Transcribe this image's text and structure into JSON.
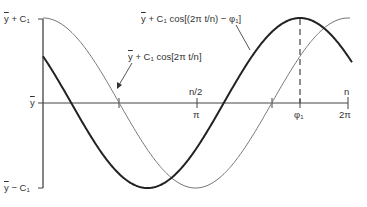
{
  "diagram": {
    "type": "cosine-phase-shift",
    "axis": {
      "y_labels": {
        "top": "y + C₁",
        "middle": "y",
        "bottom": "y − C₁"
      },
      "x_ticks": [
        {
          "top": "n/2",
          "bottom": "π"
        },
        {
          "top": "",
          "bottom": "φ₁"
        },
        {
          "top": "n",
          "bottom": "2π"
        }
      ]
    },
    "curves": [
      {
        "name": "reference",
        "label_prefix": "y",
        "label_rest": " + C₁ cos[2π t/n]",
        "style": "thin",
        "color": "#777777"
      },
      {
        "name": "shifted",
        "label_prefix": "y",
        "label_rest": " + C₁ cos[(2π t/n) − φ₁]",
        "style": "thick",
        "color": "#222222"
      }
    ],
    "colors": {
      "axis": "#444444",
      "thin": "#777777",
      "thick": "#222222",
      "background": "#ffffff"
    }
  }
}
